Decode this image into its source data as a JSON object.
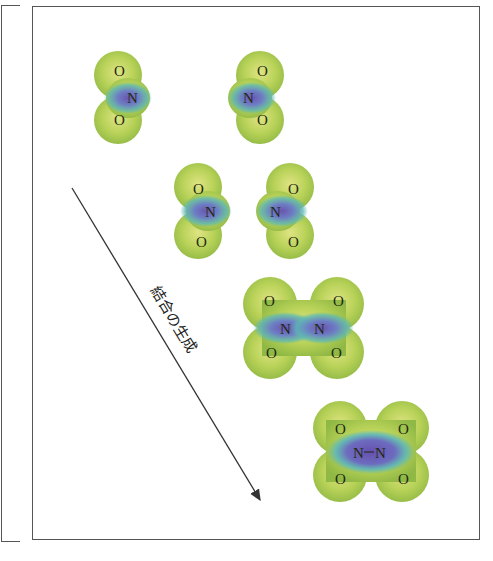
{
  "figure": {
    "arrow_label": "結合の生成",
    "colors": {
      "surface_outer": "#a8c84a",
      "surface_light": "#d6e07a",
      "surface_mid": "#5fb8b0",
      "surface_core": "#6f5fb0",
      "frame": "#555555",
      "arrow": "#333333"
    },
    "atoms": {
      "oxygen": "O",
      "nitrogen": "N",
      "bond": "—"
    },
    "stages": [
      {
        "stage": 1,
        "description": "two separated NO2 molecules"
      },
      {
        "stage": 2,
        "description": "NO2 molecules approaching"
      },
      {
        "stage": 3,
        "description": "NO2 molecules in contact"
      },
      {
        "stage": 4,
        "description": "N2O4 with N–N bond formed"
      }
    ]
  }
}
